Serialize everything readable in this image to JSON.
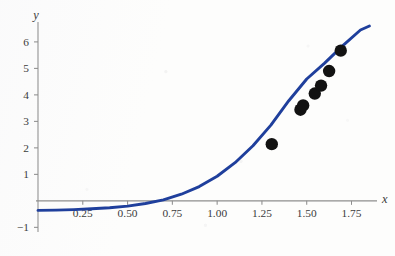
{
  "figure": {
    "title": "",
    "background_color": "#fdfdfc",
    "curve_color": "#1f3f9c",
    "point_color": "#121212",
    "axis_color": "#8e8e8e",
    "label_color": "#3b3b3b"
  },
  "axes": {
    "x_name": "x",
    "y_name": "y",
    "x_ticklabels": [
      "0.25",
      "0.50",
      "0.75",
      "1.00",
      "1.25",
      "1.50",
      "1.75"
    ],
    "x_tickvalues": [
      0.25,
      0.5,
      0.75,
      1.0,
      1.25,
      1.5,
      1.75
    ],
    "y_ticklabels": [
      "-1",
      "1",
      "2",
      "3",
      "4",
      "5",
      "6"
    ],
    "y_tickvalues": [
      -1,
      1,
      2,
      3,
      4,
      5,
      6
    ]
  },
  "chart_data": {
    "type": "scatter",
    "title": "",
    "xlabel": "x",
    "ylabel": "y",
    "xlim": [
      0.0,
      1.87
    ],
    "ylim": [
      -1.1,
      6.6
    ],
    "grid": false,
    "legend": null,
    "x_ticks": [
      0.25,
      0.5,
      0.75,
      1.0,
      1.25,
      1.5,
      1.75
    ],
    "x_tick_labels": [
      "0.25",
      "0.50",
      "0.75",
      "1.00",
      "1.25",
      "1.50",
      "1.75"
    ],
    "y_ticks": [
      -1,
      1,
      2,
      3,
      4,
      5,
      6
    ],
    "y_tick_labels": [
      "-1",
      "1",
      "2",
      "3",
      "4",
      "5",
      "6"
    ],
    "series": [
      {
        "name": "fitted curve",
        "type": "line",
        "color": "#1f3f9c",
        "linewidth": 2.9,
        "x": [
          0.0,
          0.1,
          0.2,
          0.3,
          0.4,
          0.5,
          0.6,
          0.7,
          0.8,
          0.9,
          1.0,
          1.1,
          1.2,
          1.3,
          1.4,
          1.5,
          1.6,
          1.7,
          1.8,
          1.85
        ],
        "y": [
          -0.36,
          -0.35,
          -0.33,
          -0.3,
          -0.26,
          -0.2,
          -0.1,
          0.04,
          0.25,
          0.54,
          0.93,
          1.44,
          2.08,
          2.86,
          3.78,
          4.6,
          5.2,
          5.85,
          6.45,
          6.6
        ]
      },
      {
        "name": "data points",
        "type": "scatter",
        "color": "#121212",
        "markersize": 6.2,
        "points": [
          {
            "x": 1.305,
            "y": 2.14
          },
          {
            "x": 1.465,
            "y": 3.44
          },
          {
            "x": 1.48,
            "y": 3.6
          },
          {
            "x": 1.545,
            "y": 4.05
          },
          {
            "x": 1.58,
            "y": 4.35
          },
          {
            "x": 1.625,
            "y": 4.9
          },
          {
            "x": 1.69,
            "y": 5.67
          }
        ]
      }
    ]
  }
}
